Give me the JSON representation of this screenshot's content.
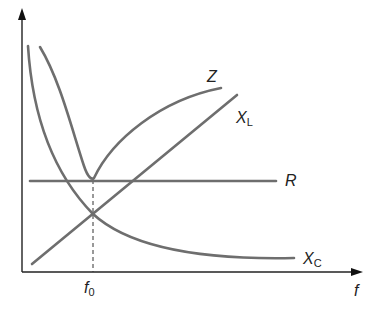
{
  "diagram": {
    "axes": {
      "x_label": "f",
      "y_label": ""
    },
    "marker": {
      "label": "f",
      "subscript": "0"
    },
    "curves": [
      {
        "name": "Z",
        "label": "Z",
        "subscript": ""
      },
      {
        "name": "XL",
        "label": "X",
        "subscript": "L"
      },
      {
        "name": "R",
        "label": "R",
        "subscript": ""
      },
      {
        "name": "XC",
        "label": "X",
        "subscript": "C"
      }
    ],
    "colors": {
      "curve": "#6e6e6e",
      "axis": "#222222"
    }
  }
}
